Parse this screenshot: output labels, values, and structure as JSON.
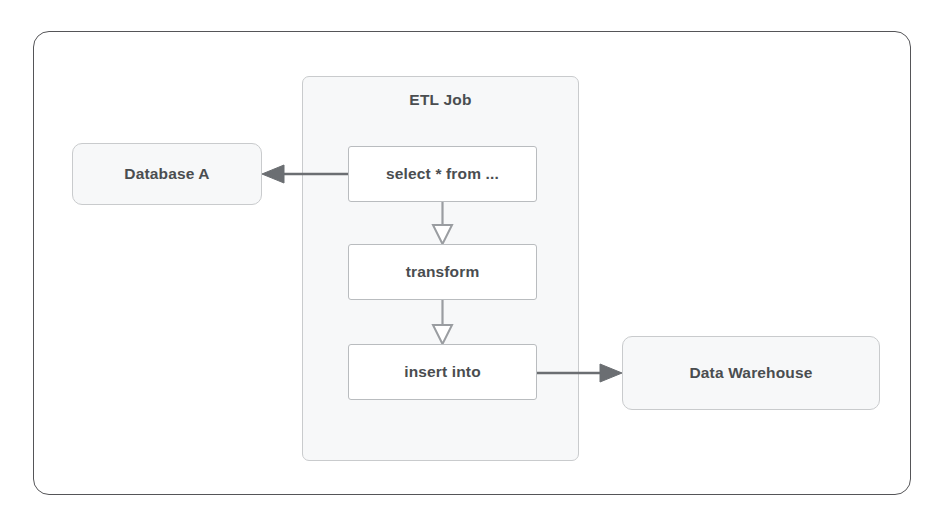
{
  "diagram": {
    "frame": {
      "name": "outer-frame"
    },
    "group": {
      "label": "ETL Job",
      "fill_color": "#f7f8f9",
      "border_color": "#c9cbcd"
    },
    "nodes": [
      {
        "id": "database-a",
        "label": "Database A",
        "kind": "store",
        "fill_color": "#f7f8f9",
        "border_color": "#c9cbcd"
      },
      {
        "id": "select",
        "label": "select * from ...",
        "kind": "step",
        "fill_color": "#ffffff",
        "border_color": "#b9bcbf"
      },
      {
        "id": "transform",
        "label": "transform",
        "kind": "step",
        "fill_color": "#ffffff",
        "border_color": "#b9bcbf"
      },
      {
        "id": "insert-into",
        "label": "insert into",
        "kind": "step",
        "fill_color": "#ffffff",
        "border_color": "#b9bcbf"
      },
      {
        "id": "data-warehouse",
        "label": "Data Warehouse",
        "kind": "store",
        "fill_color": "#f7f8f9",
        "border_color": "#c9cbcd"
      }
    ],
    "edges": [
      {
        "id": "select-to-database-a",
        "from": "select",
        "to": "database-a",
        "direction": "left",
        "arrowhead": "solid",
        "color": "#6b6e72"
      },
      {
        "id": "select-to-transform",
        "from": "select",
        "to": "transform",
        "direction": "down",
        "arrowhead": "hollow",
        "color": "#9a9da1"
      },
      {
        "id": "transform-to-insert-into",
        "from": "transform",
        "to": "insert-into",
        "direction": "down",
        "arrowhead": "hollow",
        "color": "#9a9da1"
      },
      {
        "id": "insert-into-to-data-warehouse",
        "from": "insert-into",
        "to": "data-warehouse",
        "direction": "right",
        "arrowhead": "solid",
        "color": "#6b6e72"
      }
    ],
    "colors": {
      "text": "#4a4d50",
      "frame_border": "#555558",
      "page_background": "#ffffff"
    }
  }
}
